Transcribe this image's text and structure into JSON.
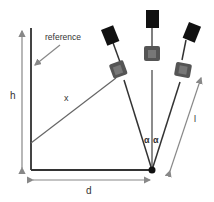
{
  "diagram": {
    "labels": {
      "reference": "reference",
      "h": "h",
      "x": "x",
      "d": "d",
      "l": "l",
      "alpha_left": "α",
      "alpha_right": "α"
    },
    "colors": {
      "line_dark": "#333333",
      "arrow_gray": "#888888",
      "camera_body": "#555555",
      "camera_face": "#777777",
      "panel_black": "#111111"
    },
    "cameras": [
      {
        "name": "left",
        "tilt_deg": -25
      },
      {
        "name": "center",
        "tilt_deg": 0
      },
      {
        "name": "right",
        "tilt_deg": 25
      }
    ]
  }
}
